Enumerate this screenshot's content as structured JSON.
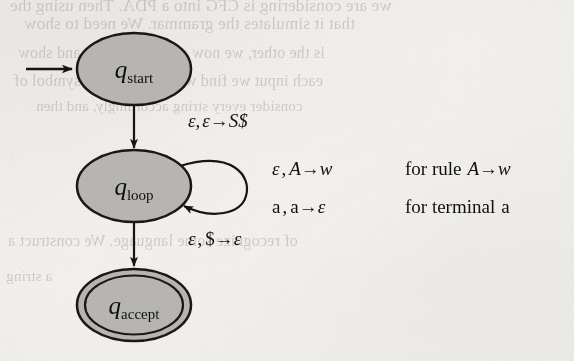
{
  "figure": {
    "kind": "pda-state-diagram",
    "background_color": "#f6f5f3",
    "ink_color": "#12110f",
    "state_fill_color": "#b9b8b5",
    "state_stroke_color": "#1a1917"
  },
  "states": [
    {
      "id": "q_start",
      "label_base": "q",
      "label_sub": "start",
      "kind": "start",
      "accepting": false,
      "cx": 134,
      "cy": 69,
      "rx": 57,
      "ry": 36
    },
    {
      "id": "q_loop",
      "label_base": "q",
      "label_sub": "loop",
      "kind": "normal",
      "accepting": false,
      "cx": 134,
      "cy": 186,
      "rx": 57,
      "ry": 36
    },
    {
      "id": "q_accept",
      "label_base": "q",
      "label_sub": "accept",
      "kind": "accept",
      "accepting": true,
      "cx": 134,
      "cy": 305,
      "rx": 57,
      "ry": 36
    }
  ],
  "transitions": [
    {
      "id": "start-arrow",
      "from": null,
      "to": "q_start",
      "label": "",
      "kind": "initial-marker"
    },
    {
      "id": "start-to-loop",
      "from": "q_start",
      "to": "q_loop",
      "kind": "straight",
      "read": "ε",
      "pop": "ε",
      "push": "S$",
      "label": "ε , ε→S$"
    },
    {
      "id": "loop-self",
      "from": "q_loop",
      "to": "q_loop",
      "kind": "self-loop",
      "label": ""
    },
    {
      "id": "loop-to-accept",
      "from": "q_loop",
      "to": "q_accept",
      "kind": "straight",
      "read": "ε",
      "pop": "$",
      "push": "ε",
      "label": "ε , $→ε"
    }
  ],
  "edge_labels": {
    "start_to_loop": {
      "eps1": "ε",
      "comma": ",",
      "eps2": "ε",
      "arrow": "→",
      "target": "S$"
    },
    "loop_to_accept": {
      "eps1": "ε",
      "comma": ",",
      "dollar": "$",
      "arrow": "→",
      "eps2": "ε"
    }
  },
  "rule_table": {
    "rows": [
      {
        "id": "variable-rule",
        "transition": {
          "read": "ε",
          "comma": ",",
          "pop": "A",
          "arrow": "→",
          "push": "w"
        },
        "condition_prefix": "for rule",
        "condition_rule": {
          "lhs": "A",
          "arrow": "→",
          "rhs": "w"
        }
      },
      {
        "id": "terminal-rule",
        "transition": {
          "read": "a",
          "comma": ",",
          "pop": "a",
          "arrow": "→",
          "push": "ε"
        },
        "condition_prefix": "for terminal",
        "condition_rule": {
          "lhs": "a",
          "arrow": "",
          "rhs": ""
        }
      }
    ]
  },
  "bleed_through_text": [
    {
      "id": "ghost-1",
      "text": "we are considering is CFG into a PDA. Then using the",
      "x": 10,
      "y": -4,
      "size": 17
    },
    {
      "id": "ghost-2",
      "text": "that it simulates the grammar. We need to show",
      "x": 24,
      "y": 14,
      "size": 17
    },
    {
      "id": "ghost-3",
      "text": "is the other, we now consider a PDA and show",
      "x": 18,
      "y": 44,
      "size": 16
    },
    {
      "id": "ghost-4",
      "text": "each input we find what is in it each symbol of",
      "x": 14,
      "y": 72,
      "size": 16
    },
    {
      "id": "ghost-5",
      "text": "consider every string accordingly, and then",
      "x": 36,
      "y": 98,
      "size": 15
    },
    {
      "id": "ghost-6",
      "text": "of recognize some language. We construct a",
      "x": 8,
      "y": 232,
      "size": 16
    },
    {
      "id": "ghost-7",
      "text": "a string",
      "x": 6,
      "y": 268,
      "size": 15
    }
  ]
}
